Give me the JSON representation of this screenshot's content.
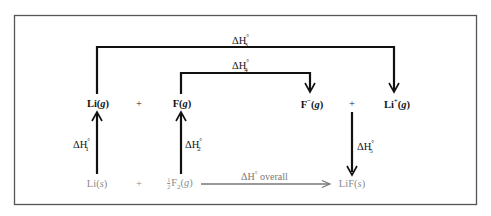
{
  "diagram": {
    "type": "Born-Haber cycle",
    "upper_species": [
      {
        "id": "li-gas",
        "text": "Li",
        "state": "g",
        "charge": ""
      },
      {
        "id": "plus-1",
        "text": "+"
      },
      {
        "id": "f-gas",
        "text": "F",
        "state": "g",
        "charge": ""
      },
      {
        "id": "f-ion",
        "text": "F",
        "state": "g",
        "charge": "−"
      },
      {
        "id": "plus-2",
        "text": "+"
      },
      {
        "id": "li-ion",
        "text": "Li",
        "state": "g",
        "charge": "+"
      }
    ],
    "lower_species": [
      {
        "id": "li-solid",
        "text": "Li",
        "state": "s"
      },
      {
        "id": "plus-3",
        "text": "+"
      },
      {
        "id": "f2-gas",
        "coef_num": "1",
        "coef_den": "2",
        "text": "F",
        "subscript": "2",
        "state": "g"
      },
      {
        "id": "lif-solid",
        "text": "LiF",
        "state": "s"
      }
    ],
    "steps": [
      {
        "id": "dh1",
        "label_main": "ΔH",
        "degree": "°",
        "index": "1",
        "from": "Li(s)",
        "to": "Li(g)"
      },
      {
        "id": "dh2",
        "label_main": "ΔH",
        "degree": "°",
        "index": "2",
        "from": "½F2(g)",
        "to": "F(g)"
      },
      {
        "id": "dh3",
        "label_main": "ΔH",
        "degree": "°",
        "index": "3",
        "from": "Li(g)",
        "to": "Li+(g)"
      },
      {
        "id": "dh4",
        "label_main": "ΔH",
        "degree": "°",
        "index": "4",
        "from": "F(g)",
        "to": "F−(g)"
      },
      {
        "id": "dh5",
        "label_main": "ΔH",
        "degree": "°",
        "index": "5",
        "from": "F−(g) + Li+(g)",
        "to": "LiF(s)"
      },
      {
        "id": "dh-overall",
        "label_main": "ΔH",
        "degree": "°",
        "suffix": "overall",
        "from": "½F2(g)",
        "to": "LiF(s)"
      }
    ],
    "colors": {
      "stroke": "#111111",
      "frame": "#555555",
      "solid_text": "#8a8a8a",
      "overall_arrow": "#777777"
    }
  }
}
